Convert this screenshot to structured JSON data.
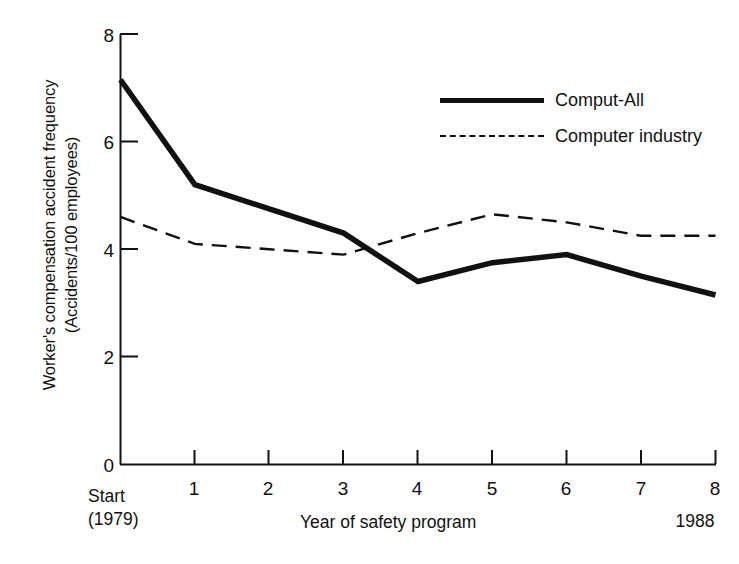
{
  "chart_data": {
    "type": "line",
    "title": "",
    "xlabel": "Year of safety program",
    "ylabel": "Worker's compensation accident frequency (Accidents/100 employees)",
    "ylabel_line1": "Worker's compensation accident frequency",
    "ylabel_line2": "(Accidents/100 employees)",
    "x": [
      0,
      1,
      2,
      3,
      4,
      5,
      6,
      7,
      8
    ],
    "categories": [
      "Start",
      "1",
      "2",
      "3",
      "4",
      "5",
      "6",
      "7",
      "8"
    ],
    "xtick_labels": [
      "1",
      "2",
      "3",
      "4",
      "5",
      "6",
      "7",
      "8"
    ],
    "ytick_labels": [
      "0",
      "2",
      "4",
      "6",
      "8"
    ],
    "ytick_values": [
      0,
      2,
      4,
      6,
      8
    ],
    "xlim": [
      0,
      8
    ],
    "ylim": [
      0,
      8
    ],
    "grid": false,
    "legend_position": "upper right",
    "start_label_line1": "Start",
    "start_label_line2": "(1979)",
    "end_label": "1988",
    "series": [
      {
        "name": "Comput-All",
        "style": "solid",
        "width": "thick",
        "color": "#111111",
        "values": [
          7.15,
          5.2,
          4.75,
          4.3,
          3.4,
          3.75,
          3.9,
          3.5,
          3.15
        ]
      },
      {
        "name": "Computer industry",
        "style": "dashed",
        "width": "thin",
        "color": "#111111",
        "values": [
          4.6,
          4.1,
          4.0,
          3.9,
          4.3,
          4.65,
          4.5,
          4.25,
          4.25
        ]
      }
    ]
  },
  "legend": {
    "items": [
      {
        "label": "Comput-All",
        "style": "solid"
      },
      {
        "label": "Computer industry",
        "style": "dashed"
      }
    ]
  },
  "axis": {
    "y_label_line1": "Worker's compensation accident frequency",
    "y_label_line2": "(Accidents/100 employees)",
    "x_title": "Year of safety program",
    "origin_label_line1": "Start",
    "origin_label_line2": "(1979)",
    "end_label": "1988"
  },
  "colors": {
    "ink": "#111111",
    "background": "#ffffff"
  }
}
